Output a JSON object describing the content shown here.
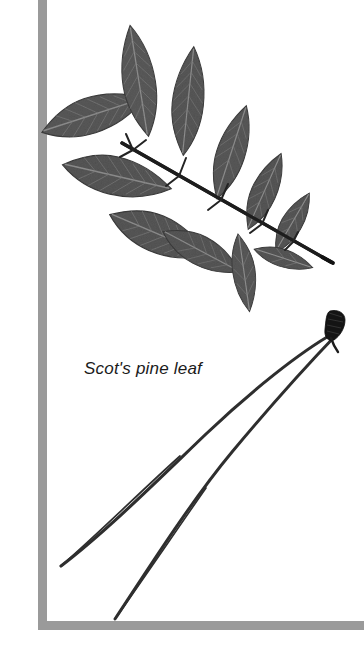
{
  "image": {
    "kind": "botanical-specimen-photo",
    "width": 364,
    "height": 646,
    "background_color": "#ffffff",
    "subjects": [
      "ash-compound-leaf",
      "scots-pine-needle-pair"
    ]
  },
  "caption": {
    "text": "Scot's pine leaf",
    "style": "italic",
    "color": "#1b1b1b",
    "font_size_px": 17,
    "x": 84,
    "y": 358
  },
  "frame": {
    "name": "gray-corner-rule",
    "color": "#9a9a9a",
    "vertical_rule": {
      "x": 38,
      "y": 0,
      "width": 9,
      "height": 630
    },
    "horizontal_rule": {
      "x": 38,
      "y": 621,
      "width": 326,
      "height": 9
    }
  },
  "specimens": {
    "compound_leaf": {
      "name": "ash-compound-leaf",
      "common_label": "pinnately compound leaf",
      "leaflet_color": "#5a5a5a",
      "leaflet_edge_color": "#3f3f3f",
      "vein_color": "#8d8d8d",
      "rachis_color": "#1d1d1d",
      "rachis_start": {
        "x": 123,
        "y": 144
      },
      "rachis_end": {
        "x": 331,
        "y": 262
      },
      "leaflet_count": 11,
      "bounds": {
        "x": 18,
        "y": 26,
        "width": 316,
        "height": 264
      },
      "leaflets": [
        {
          "id": "left-1-upper",
          "cx": 92,
          "cy": 115,
          "rx": 56,
          "ry": 23,
          "angle": -18
        },
        {
          "id": "left-2-mid",
          "cx": 118,
          "cy": 175,
          "rx": 60,
          "ry": 24,
          "angle": 13
        },
        {
          "id": "left-3-lower",
          "cx": 160,
          "cy": 232,
          "rx": 58,
          "ry": 23,
          "angle": 22
        },
        {
          "id": "top-1",
          "cx": 140,
          "cy": 80,
          "rx": 25,
          "ry": 57,
          "angle": -9
        },
        {
          "id": "top-2",
          "cx": 189,
          "cy": 100,
          "rx": 24,
          "ry": 55,
          "angle": 4
        },
        {
          "id": "right-1",
          "cx": 231,
          "cy": 151,
          "rx": 22,
          "ry": 49,
          "angle": 16
        },
        {
          "id": "right-2",
          "cx": 265,
          "cy": 190,
          "rx": 19,
          "ry": 41,
          "angle": 22
        },
        {
          "id": "right-3",
          "cx": 293,
          "cy": 222,
          "rx": 17,
          "ry": 33,
          "angle": 28
        },
        {
          "id": "below-1",
          "cx": 203,
          "cy": 250,
          "rx": 43,
          "ry": 19,
          "angle": 27
        },
        {
          "id": "below-2",
          "cx": 244,
          "cy": 268,
          "rx": 16,
          "ry": 34,
          "angle": 10
        },
        {
          "id": "below-3",
          "cx": 283,
          "cy": 258,
          "rx": 26,
          "ry": 14,
          "angle": 22
        }
      ]
    },
    "pine_needles": {
      "name": "scots-pine-needle-pair",
      "needle_color": "#2a2a2a",
      "sheath_color": "#141414",
      "needle_count": 2,
      "sheath": {
        "x": 331,
        "y": 312,
        "width": 14,
        "height": 26
      },
      "bounds": {
        "x": 58,
        "y": 310,
        "width": 288,
        "height": 312
      },
      "needles": [
        {
          "id": "needle-outer",
          "start": {
            "x": 334,
            "y": 332
          },
          "tip": {
            "x": 60,
            "y": 566
          }
        },
        {
          "id": "needle-inner",
          "start": {
            "x": 337,
            "y": 332
          },
          "tip": {
            "x": 114,
            "y": 620
          }
        }
      ]
    }
  }
}
